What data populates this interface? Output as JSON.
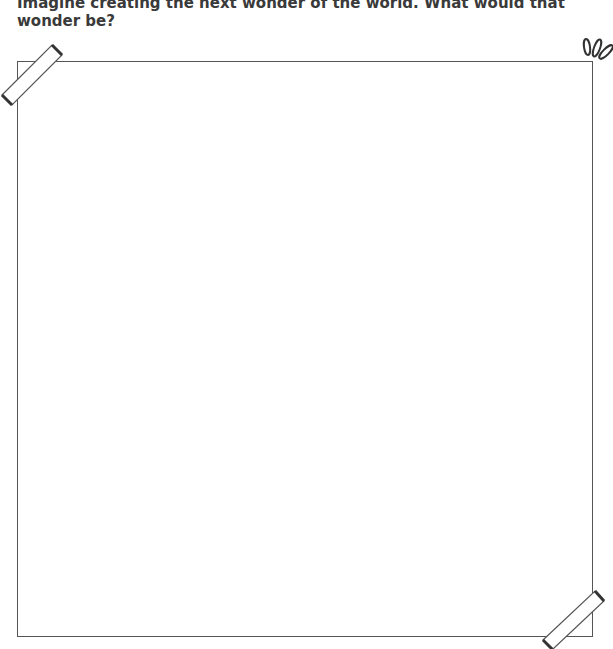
{
  "worksheet": {
    "prompt": "Imagine creating the next wonder of the world. What would that wonder be?",
    "drawing_area": {
      "content": ""
    },
    "decorations": [
      "tape-top-left",
      "tape-bottom-right",
      "sparkle-top-right"
    ]
  }
}
